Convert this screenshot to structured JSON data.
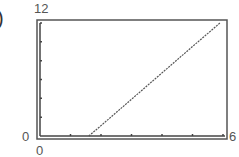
{
  "panel": {
    "label_fragment": ")"
  },
  "window": {
    "xmin": "0",
    "xmax": "6",
    "ymin": "0",
    "ymax": "12",
    "ymin_left": "0"
  },
  "chart_data": {
    "type": "line",
    "title": "",
    "xlabel": "",
    "ylabel": "",
    "xlim": [
      0,
      6
    ],
    "ylim": [
      0,
      12
    ],
    "xticks_step": 1,
    "yticks_step": 2,
    "tick_labels": {
      "x_min": "0",
      "x_max": "6",
      "y_min": "0",
      "y_max": "12"
    },
    "grid": false,
    "legend": null,
    "series": [
      {
        "name": "graph",
        "x": [
          1.6,
          2,
          3,
          4,
          5,
          5.9
        ],
        "y": [
          0,
          1.1,
          3.9,
          6.7,
          9.5,
          12
        ]
      }
    ]
  }
}
